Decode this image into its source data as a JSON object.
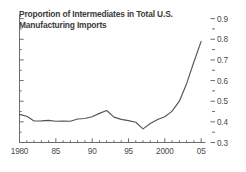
{
  "chart_data": {
    "type": "line",
    "title": "Proportion of Intermediates in Total U.S.\nManufacturing Imports",
    "xlabel": "",
    "ylabel": "",
    "xlim": [
      1980,
      2005.6
    ],
    "ylim": [
      0.3,
      0.92
    ],
    "grid": false,
    "legend": null,
    "line_color": "#555555",
    "text_color": "#3b3b3b",
    "axis_color": "#6b6b6b",
    "background": "#ffffff",
    "y_axis_position": "right",
    "x_tick_labels": [
      "1980",
      "85",
      "90",
      "95",
      "2000",
      "05"
    ],
    "x_tick_values": [
      1980,
      1985,
      1990,
      1995,
      2000,
      2005
    ],
    "x_minor_tick_step": 1,
    "y_tick_labels": [
      "0.3",
      "0.4",
      "0.5",
      "0.6",
      "0.7",
      "0.8",
      "0.9"
    ],
    "y_tick_values": [
      0.3,
      0.4,
      0.5,
      0.6,
      0.7,
      0.8,
      0.9
    ],
    "y_minor_tick_values": [
      0.35,
      0.45,
      0.55,
      0.65,
      0.75,
      0.85
    ],
    "x": [
      1980,
      1981,
      1982,
      1983,
      1984,
      1985,
      1986,
      1987,
      1988,
      1989,
      1990,
      1991,
      1992,
      1993,
      1994,
      1995,
      1996,
      1997,
      1998,
      1999,
      2000,
      2001,
      2002,
      2003,
      2004,
      2005
    ],
    "values": [
      0.436,
      0.427,
      0.404,
      0.405,
      0.407,
      0.403,
      0.404,
      0.403,
      0.414,
      0.416,
      0.425,
      0.441,
      0.455,
      0.423,
      0.412,
      0.406,
      0.398,
      0.366,
      0.392,
      0.411,
      0.425,
      0.452,
      0.5,
      0.585,
      0.69,
      0.79
    ]
  }
}
